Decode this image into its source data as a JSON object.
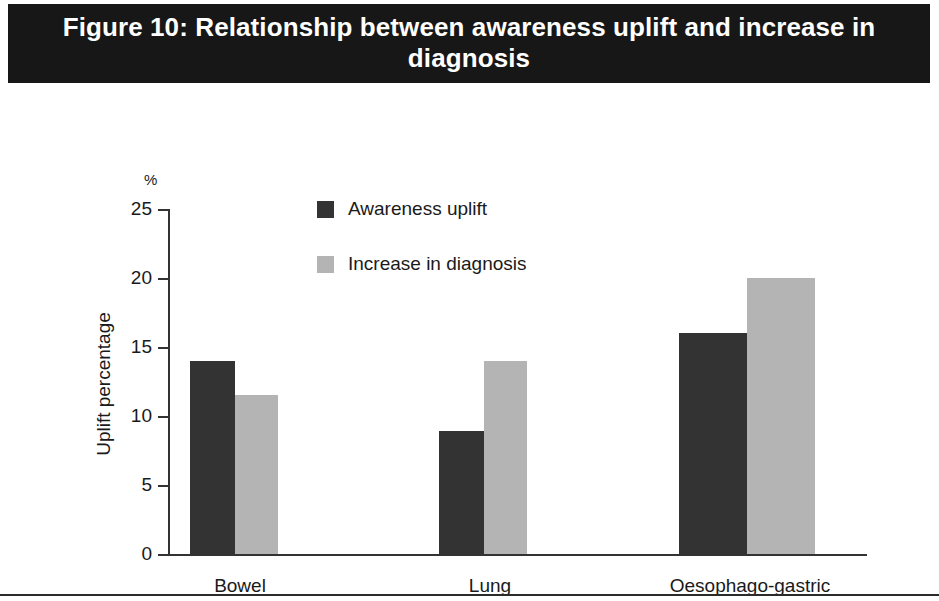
{
  "title": "Figure 10: Relationship between awareness uplift and increase in diagnosis",
  "unit_label": "%",
  "axis_titles": {
    "y": "Uplift percentage",
    "x": "Cancer type"
  },
  "legend": {
    "items": [
      {
        "label": "Awareness uplift",
        "color": "#333333",
        "icon": "square-swatch"
      },
      {
        "label": "Increase in diagnosis",
        "color": "#b4b4b4",
        "icon": "square-swatch"
      }
    ]
  },
  "y_ticks": [
    "0",
    "5",
    "10",
    "15",
    "20",
    "25"
  ],
  "chart_data": {
    "type": "bar",
    "title": "Figure 10: Relationship between awareness uplift and increase in diagnosis",
    "xlabel": "Cancer type",
    "ylabel": "Uplift percentage",
    "unit": "%",
    "categories": [
      "Bowel",
      "Lung",
      "Oesophago-gastric"
    ],
    "series": [
      {
        "name": "Awareness uplift",
        "color": "#333333",
        "values": [
          14.0,
          8.9,
          16.0
        ]
      },
      {
        "name": "Increase in diagnosis",
        "color": "#b4b4b4",
        "values": [
          11.5,
          14.0,
          20.0
        ]
      }
    ],
    "ylim": [
      0,
      25
    ],
    "yticks": [
      0,
      5,
      10,
      15,
      20,
      25
    ],
    "grid": false,
    "legend_position": "top-center"
  }
}
